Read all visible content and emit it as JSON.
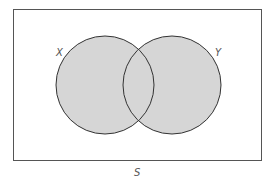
{
  "diagram": {
    "type": "venn",
    "universe_label": "S",
    "sets": [
      {
        "label": "X",
        "shaded": true
      },
      {
        "label": "Y",
        "shaded": true
      }
    ],
    "shaded_region": "X ∪ Y",
    "colors": {
      "fill": "#d6d6d6",
      "stroke": "#333333",
      "border": "#555555"
    }
  }
}
